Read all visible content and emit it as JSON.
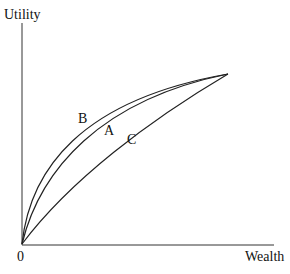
{
  "diagram": {
    "type": "utility-curves",
    "y_axis_label": "Utility",
    "x_axis_label": "Wealth",
    "origin_label": "0",
    "curves": [
      {
        "name": "B",
        "label": "B",
        "description": "most concave curve"
      },
      {
        "name": "A",
        "label": "A",
        "description": "middle concave curve"
      },
      {
        "name": "C",
        "label": "C",
        "description": "least concave curve"
      }
    ],
    "colors": {
      "line": "#222222",
      "background": "#ffffff"
    }
  }
}
